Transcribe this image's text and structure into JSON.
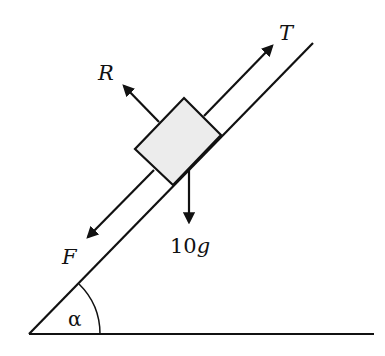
{
  "figure": {
    "type": "inclined-plane-force-diagram",
    "incline_angle_label": "α",
    "forces": [
      {
        "id": "tension",
        "label": "T",
        "direction": "up-slope"
      },
      {
        "id": "normal",
        "label": "R",
        "direction": "perpendicular-to-slope"
      },
      {
        "id": "friction",
        "label": "F",
        "direction": "down-slope"
      },
      {
        "id": "weight",
        "label": "10g",
        "direction": "vertically-down"
      }
    ],
    "colors": {
      "line": "#111111",
      "block_fill": "#ececec"
    }
  }
}
